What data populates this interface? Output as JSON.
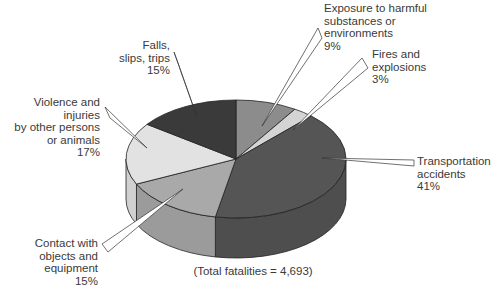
{
  "chart_data": {
    "type": "pie",
    "title": "",
    "style": "3d-pie",
    "footnote": "(Total fatalities = 4,693)",
    "total": 4693,
    "categories": [
      "Exposure to harmful substances or environments",
      "Fires and explosions",
      "Transportation accidents",
      "Contact with objects and equipment",
      "Violence and injuries by other persons or animals",
      "Falls, slips, trips"
    ],
    "values": [
      9,
      3,
      41,
      15,
      17,
      15
    ],
    "unit": "%",
    "colors": [
      "#8c8c8c",
      "#d4d4d4",
      "#555555",
      "#a9a9a9",
      "#e2e2e2",
      "#3a3a3a"
    ],
    "labels": [
      {
        "text": "Exposure to harmful\nsubstances or\nenvironments\n9%"
      },
      {
        "text": "Fires and\nexplosions\n3%"
      },
      {
        "text": "Transportation\naccidents\n41%"
      },
      {
        "text": "Contact with\nobjects and\nequipment\n15%"
      },
      {
        "text": "Violence and injuries\nby other persons\nor animals\n17%"
      },
      {
        "text": "Falls,\nslips, trips\n15%"
      }
    ]
  }
}
